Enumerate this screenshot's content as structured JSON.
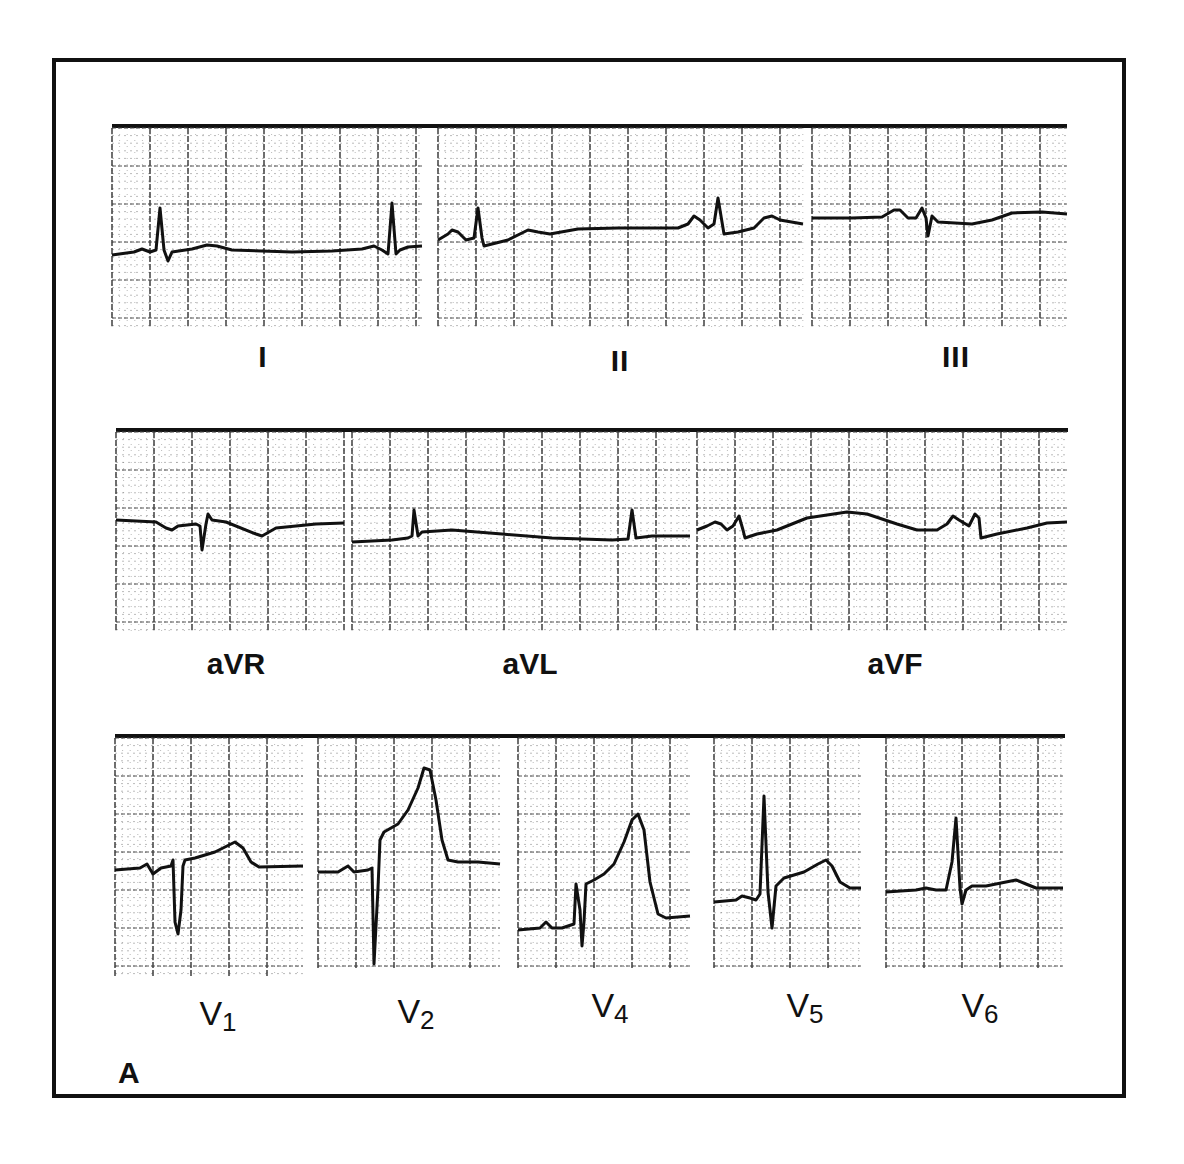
{
  "figure": {
    "panel_letter": "A",
    "rows": [
      {
        "name": "limb-leads",
        "leads": [
          {
            "id": "I",
            "label": "I"
          },
          {
            "id": "II",
            "label": "II"
          },
          {
            "id": "III",
            "label": "III"
          }
        ]
      },
      {
        "name": "augmented-leads",
        "leads": [
          {
            "id": "aVR",
            "label": "aVR"
          },
          {
            "id": "aVL",
            "label": "aVL"
          },
          {
            "id": "aVF",
            "label": "aVF"
          }
        ]
      },
      {
        "name": "precordial-leads",
        "leads": [
          {
            "id": "V1",
            "label": "V",
            "sub": "1"
          },
          {
            "id": "V2",
            "label": "V",
            "sub": "2"
          },
          {
            "id": "V4",
            "label": "V",
            "sub": "4"
          },
          {
            "id": "V5",
            "label": "V",
            "sub": "5"
          },
          {
            "id": "V6",
            "label": "V",
            "sub": "6"
          }
        ]
      }
    ],
    "colors": {
      "ink": "#111111",
      "paper": "#ffffff",
      "grid": "#555555"
    }
  }
}
